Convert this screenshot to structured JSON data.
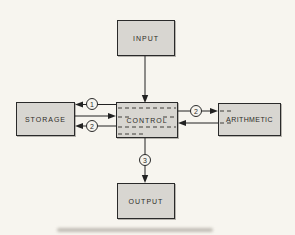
{
  "figure": {
    "blocks": {
      "input": {
        "label": "INPUT"
      },
      "storage": {
        "label": "STORAGE"
      },
      "control": {
        "label": "CONTROL"
      },
      "arithmetic": {
        "label": "ARITHMETIC"
      },
      "output": {
        "label": "OUTPUT"
      }
    },
    "markers": {
      "storage_top": "1",
      "storage_bottom": "2",
      "arithmetic": "2",
      "output": "3"
    },
    "colors": {
      "background": "#f7f5ef",
      "box_fill": "#d8d6d1",
      "line": "#222222"
    }
  }
}
